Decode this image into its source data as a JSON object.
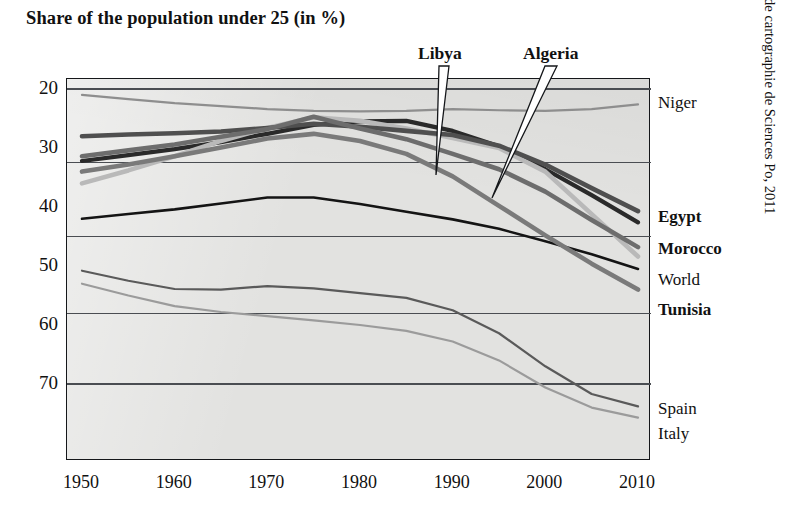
{
  "title": "Share of the population under 25 (in %)",
  "credit": "Ceri and Atelier de cartographie de Sciences Po, 2011",
  "axes": {
    "y_ticks": [
      "70",
      "60",
      "50",
      "40",
      "30",
      "20"
    ],
    "x_ticks": [
      "1950",
      "1960",
      "1970",
      "1980",
      "1990",
      "2000",
      "2010"
    ]
  },
  "callouts": [
    {
      "label": "Libya"
    },
    {
      "label": "Algeria"
    }
  ],
  "right_labels": [
    {
      "label": "Niger",
      "bold": false
    },
    {
      "label": "Egypt",
      "bold": true
    },
    {
      "label": "Morocco",
      "bold": true
    },
    {
      "label": "World",
      "bold": false
    },
    {
      "label": "Tunisia",
      "bold": true
    },
    {
      "label": "Spain",
      "bold": false
    },
    {
      "label": "Italy",
      "bold": false
    }
  ],
  "chart_data": {
    "type": "line",
    "title": "Share of the population under 25 (in %)",
    "xlabel": "",
    "ylabel": "",
    "xlim": [
      1950,
      2010
    ],
    "ylim": [
      12,
      72
    ],
    "y_ticks": [
      20,
      30,
      40,
      50,
      60,
      70
    ],
    "x_ticks": [
      1950,
      1960,
      1970,
      1980,
      1990,
      2000,
      2010
    ],
    "grid": true,
    "gridlines_y": [
      70,
      57.5,
      45,
      32,
      20
    ],
    "legend": "right-edge series labels",
    "x": [
      1950,
      1955,
      1960,
      1965,
      1970,
      1975,
      1980,
      1985,
      1990,
      1995,
      2000,
      2005,
      2010
    ],
    "series": [
      {
        "name": "Niger",
        "color": "#8e8e8e",
        "width": 2.2,
        "values": [
          69.0,
          68.3,
          67.6,
          67.1,
          66.6,
          66.3,
          66.2,
          66.3,
          66.6,
          66.4,
          66.3,
          66.6,
          67.4
        ]
      },
      {
        "name": "Libya",
        "color": "#2a2a2a",
        "width": 4.2,
        "values": [
          57.8,
          58.8,
          59.8,
          61.0,
          62.4,
          63.9,
          64.5,
          64.6,
          62.9,
          60.3,
          56.4,
          52.0,
          47.4
        ]
      },
      {
        "name": "Algeria",
        "color": "#b9b9b9",
        "width": 4.6,
        "values": [
          54.0,
          56.2,
          58.6,
          61.2,
          63.4,
          65.2,
          64.6,
          63.3,
          61.7,
          60.0,
          56.0,
          48.8,
          41.6
        ]
      },
      {
        "name": "Egypt",
        "color": "#4f4f4f",
        "width": 4.6,
        "values": [
          62.0,
          62.3,
          62.5,
          62.8,
          63.4,
          64.1,
          63.6,
          62.9,
          62.2,
          60.4,
          57.2,
          53.2,
          49.3
        ]
      },
      {
        "name": "Morocco",
        "color": "#6d6d6d",
        "width": 4.6,
        "values": [
          58.6,
          59.6,
          60.6,
          61.9,
          63.2,
          65.3,
          63.3,
          61.5,
          59.0,
          56.4,
          52.6,
          47.8,
          43.2
        ]
      },
      {
        "name": "World",
        "color": "#141414",
        "width": 2.6,
        "values": [
          48.0,
          48.8,
          49.6,
          50.6,
          51.6,
          51.6,
          50.5,
          49.2,
          47.9,
          46.3,
          44.2,
          42.0,
          39.5
        ]
      },
      {
        "name": "Tunisia",
        "color": "#7a7a7a",
        "width": 4.6,
        "values": [
          56.0,
          57.2,
          58.6,
          60.1,
          61.6,
          62.4,
          61.2,
          59.0,
          55.2,
          50.2,
          45.2,
          40.4,
          36.0
        ]
      },
      {
        "name": "Spain",
        "color": "#5a5a5a",
        "width": 2.2,
        "values": [
          39.2,
          37.5,
          36.1,
          36.0,
          36.6,
          36.2,
          35.4,
          34.6,
          32.5,
          28.6,
          23.0,
          18.3,
          16.2
        ]
      },
      {
        "name": "Italy",
        "color": "#9b9b9b",
        "width": 2.2,
        "values": [
          37.0,
          35.0,
          33.2,
          32.2,
          31.5,
          30.8,
          30.0,
          29.0,
          27.2,
          24.0,
          19.4,
          16.0,
          14.3
        ]
      }
    ]
  }
}
